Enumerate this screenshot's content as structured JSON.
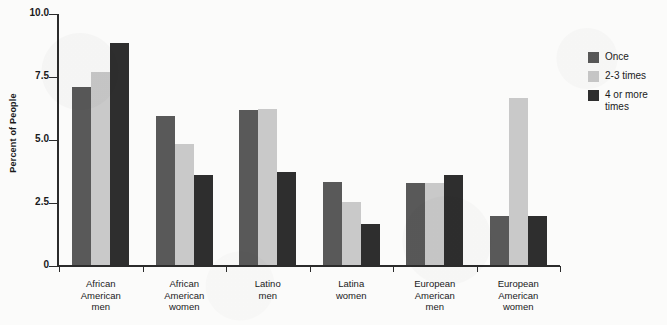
{
  "chart_data": {
    "type": "bar",
    "title": "",
    "xlabel": "",
    "ylabel": "Percent of People",
    "ylim": [
      0,
      10.0
    ],
    "ytick_labels": [
      "10.0",
      "7.5",
      "5.0",
      "2.5",
      "0"
    ],
    "ytick_values": [
      10.0,
      7.5,
      5.0,
      2.5,
      0
    ],
    "grid": false,
    "legend_position": "right",
    "categories": [
      "African American men",
      "African American women",
      "Latino men",
      "Latina women",
      "European American men",
      "European American women"
    ],
    "category_label_lines": [
      [
        "African",
        "American",
        "men"
      ],
      [
        "African",
        "American",
        "women"
      ],
      [
        "Latino",
        "men"
      ],
      [
        "Latina",
        "women"
      ],
      [
        "European",
        "American",
        "men"
      ],
      [
        "European",
        "American",
        "women"
      ]
    ],
    "series": [
      {
        "name": "Once",
        "color": "#595959",
        "values": [
          7.1,
          5.95,
          6.2,
          3.35,
          3.3,
          2.0
        ]
      },
      {
        "name": "2-3 times",
        "color": "#c9c9c9",
        "values": [
          7.7,
          4.85,
          6.25,
          2.55,
          3.3,
          6.65
        ]
      },
      {
        "name": "4 or more times",
        "color": "#2e2e2e",
        "values": [
          8.85,
          3.6,
          3.75,
          1.65,
          3.6,
          2.0
        ]
      }
    ]
  },
  "legend": {
    "entries": [
      {
        "label": "Once",
        "color": "#595959"
      },
      {
        "label": "2-3 times",
        "color": "#c9c9c9"
      },
      {
        "label": "4 or more times",
        "color": "#2e2e2e"
      }
    ]
  }
}
